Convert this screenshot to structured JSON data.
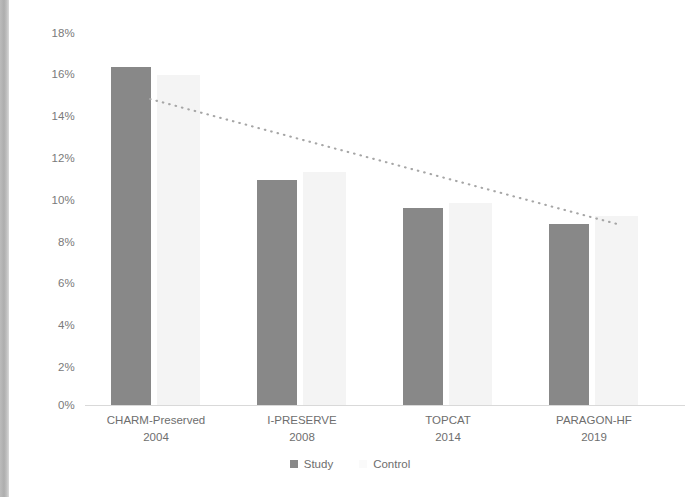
{
  "chart_data": {
    "type": "bar",
    "title": "",
    "subtitle": "",
    "xlabel": "",
    "ylabel": "",
    "ylim": [
      0,
      18
    ],
    "grid": false,
    "legend_position": "bottom",
    "categories": [
      {
        "name": "CHARM-Preserved",
        "year": "2004"
      },
      {
        "name": "I-PRESERVE",
        "year": "2008"
      },
      {
        "name": "TOPCAT",
        "year": "2014"
      },
      {
        "name": "PARAGON-HF",
        "year": "2019"
      }
    ],
    "category_labels": [
      "CHARM-Preserved 2004",
      "I-PRESERVE 2008",
      "TOPCAT 2014",
      "PARAGON-HF 2019"
    ],
    "series": [
      {
        "name": "Study",
        "color": "#888888",
        "values": [
          16.1,
          10.7,
          9.4,
          8.6
        ]
      },
      {
        "name": "Control",
        "color": "#f4f4f4",
        "values": [
          15.7,
          11.1,
          9.6,
          9.0
        ]
      }
    ],
    "y_ticks": [
      "0%",
      "2%",
      "4%",
      "6%",
      "8%",
      "10%",
      "12%",
      "14%",
      "16%",
      "18%"
    ],
    "y_tick_values": [
      0,
      2,
      4,
      6,
      8,
      10,
      12,
      14,
      16,
      18
    ],
    "annotations": [
      {
        "type": "trendline",
        "style": "dotted",
        "color": "#a0a0a0",
        "from": {
          "category_index": 0,
          "value": 14.7
        },
        "to": {
          "category_index": 3,
          "value": 8.7
        }
      }
    ]
  },
  "legend": {
    "items": [
      {
        "label": "Study",
        "color": "#888888"
      },
      {
        "label": "Control",
        "color": "#fafafa"
      }
    ]
  }
}
